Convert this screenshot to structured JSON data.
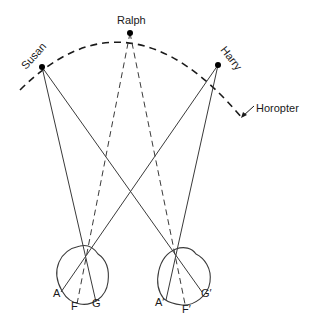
{
  "colors": {
    "line": "#3a3a3a",
    "dot": "#000000",
    "background": "#ffffff"
  },
  "points": {
    "susan": {
      "label": "Susan"
    },
    "ralph": {
      "label": "Ralph"
    },
    "harry": {
      "label": "Harry"
    }
  },
  "curve": {
    "label": "Horopter"
  },
  "left_eye": {
    "labels": {
      "a": "A",
      "f": "F",
      "g": "G"
    }
  },
  "right_eye": {
    "labels": {
      "a": "A′",
      "f": "F′",
      "g": "G′"
    }
  }
}
